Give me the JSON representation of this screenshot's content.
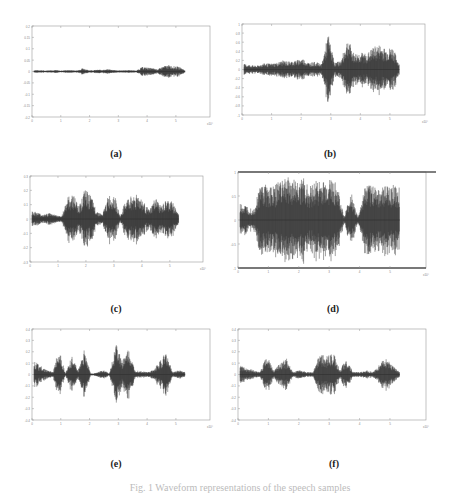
{
  "figure": {
    "caption": "Fig. 1  Waveform representations of the speech samples",
    "panels": [
      {
        "label": "(a)",
        "id": "a"
      },
      {
        "label": "(b)",
        "id": "b"
      },
      {
        "label": "(c)",
        "id": "c"
      },
      {
        "label": "(d)",
        "id": "d"
      },
      {
        "label": "(e)",
        "id": "e"
      },
      {
        "label": "(f)",
        "id": "f"
      }
    ]
  },
  "chart_data": [
    {
      "type": "line",
      "title": "(a)",
      "xlabel": "",
      "ylabel": "",
      "x_ticks": [
        "0",
        "1",
        "2",
        "3",
        "4",
        "5"
      ],
      "x_exponent": "x10^4",
      "y_ticks": [
        "-0.2",
        "-0.15",
        "-0.1",
        "-0.05",
        "0",
        "0.05",
        "0.1",
        "0.15",
        "0.2"
      ],
      "grid": false,
      "envelope": [
        0.03,
        0.03,
        0.02,
        0.03,
        0.03,
        0.02,
        0.03,
        0.03,
        0.02,
        0.08,
        0.03,
        0.03,
        0.04,
        0.04,
        0.05,
        0.03,
        0.02,
        0.03,
        0.03,
        0.02,
        0.1,
        0.09,
        0.07,
        0.05,
        0.12,
        0.14,
        0.12,
        0.1,
        0.03
      ]
    },
    {
      "type": "line",
      "title": "(b)",
      "xlabel": "",
      "ylabel": "",
      "x_ticks": [
        "0",
        "1",
        "2",
        "3",
        "4",
        "5"
      ],
      "x_exponent": "x10^4",
      "y_ticks": [
        "-1",
        "-0.8",
        "-0.6",
        "-0.4",
        "-0.2",
        "0",
        "0.2",
        "0.4",
        "0.6",
        "0.8",
        "1"
      ],
      "grid": false,
      "envelope": [
        0.12,
        0.1,
        0.08,
        0.14,
        0.13,
        0.15,
        0.2,
        0.18,
        0.2,
        0.25,
        0.15,
        0.17,
        0.12,
        0.8,
        0.15,
        0.2,
        0.7,
        0.35,
        0.38,
        0.35,
        0.5,
        0.55,
        0.45,
        0.5,
        0.1
      ]
    },
    {
      "type": "line",
      "title": "(c)",
      "xlabel": "",
      "ylabel": "",
      "x_ticks": [
        "0",
        "1",
        "2",
        "3",
        "4",
        "5"
      ],
      "x_exponent": "x10^4",
      "y_ticks": [
        "-0.3",
        "-0.2",
        "-0.1",
        "0",
        "0.1",
        "0.2",
        "0.3"
      ],
      "grid": false,
      "envelope": [
        0.2,
        0.15,
        0.1,
        0.15,
        0.1,
        0.05,
        0.5,
        0.6,
        0.3,
        0.7,
        0.55,
        0.2,
        0.1,
        0.55,
        0.6,
        0.05,
        0.45,
        0.55,
        0.6,
        0.4,
        0.2,
        0.5,
        0.3,
        0.45,
        0.4,
        0.1
      ]
    },
    {
      "type": "line",
      "title": "(d)",
      "xlabel": "",
      "ylabel": "",
      "x_ticks": [
        "0",
        "1",
        "2",
        "3",
        "4",
        "5"
      ],
      "x_exponent": "x10^4",
      "y_ticks": [
        "-1",
        "-0.5",
        "0",
        "0.5",
        "1"
      ],
      "grid": false,
      "envelope": [
        0.35,
        0.3,
        0.25,
        0.8,
        0.75,
        0.7,
        0.95,
        0.9,
        0.85,
        0.9,
        0.7,
        0.85,
        0.8,
        0.9,
        0.75,
        0.05,
        0.6,
        0.05,
        0.7,
        0.75,
        0.7,
        0.7,
        0.75,
        0.7
      ]
    },
    {
      "type": "line",
      "title": "(e)",
      "xlabel": "",
      "ylabel": "",
      "x_ticks": [
        "0",
        "1",
        "2",
        "3",
        "4",
        "5"
      ],
      "x_exponent": "x10^4",
      "y_ticks": [
        "-0.4",
        "-0.3",
        "-0.2",
        "-0.1",
        "0",
        "0.1",
        "0.2",
        "0.3",
        "0.4"
      ],
      "grid": false,
      "envelope": [
        0.3,
        0.2,
        0.1,
        0.05,
        0.6,
        0.02,
        0.4,
        0.1,
        0.55,
        0.02,
        0.04,
        0.1,
        0.02,
        0.7,
        0.3,
        0.55,
        0.1,
        0.08,
        0.05,
        0.1,
        0.3,
        0.5,
        0.05,
        0.1,
        0.06
      ]
    },
    {
      "type": "line",
      "title": "(f)",
      "xlabel": "",
      "ylabel": "",
      "x_ticks": [
        "0",
        "1",
        "2",
        "3",
        "4",
        "5"
      ],
      "x_exponent": "x10^4",
      "y_ticks": [
        "-0.4",
        "-0.3",
        "-0.2",
        "-0.1",
        "0",
        "0.1",
        "0.2",
        "0.3",
        "0.4"
      ],
      "grid": false,
      "envelope": [
        0.2,
        0.15,
        0.1,
        0.05,
        0.45,
        0.1,
        0.25,
        0.35,
        0.05,
        0.1,
        0.05,
        0.05,
        0.5,
        0.4,
        0.5,
        0.1,
        0.35,
        0.05,
        0.05,
        0.1,
        0.05,
        0.25,
        0.35,
        0.2,
        0.05
      ]
    }
  ]
}
